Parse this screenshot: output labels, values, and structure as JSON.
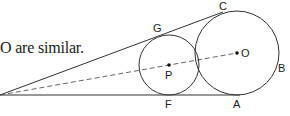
{
  "caption": {
    "text": "O are similar."
  },
  "diagram": {
    "points": {
      "G": "G",
      "C": "C",
      "P": "P",
      "O": "O",
      "B": "B",
      "F": "F",
      "A": "A"
    },
    "circles": [
      {
        "center": "P",
        "relative_size": "small"
      },
      {
        "center": "O",
        "relative_size": "large"
      }
    ],
    "lines": [
      {
        "type": "tangent",
        "through": [
          "G",
          "C"
        ],
        "style": "solid"
      },
      {
        "type": "tangent",
        "through": [
          "F",
          "A"
        ],
        "style": "solid"
      },
      {
        "type": "center-line",
        "through": [
          "P",
          "O"
        ],
        "style": "dashed"
      }
    ],
    "stroke_color": "#333333"
  }
}
